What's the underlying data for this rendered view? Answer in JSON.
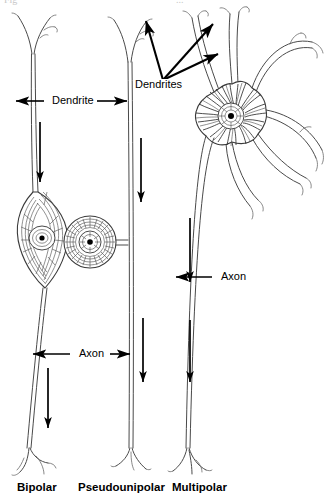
{
  "figure": {
    "background_color": "#ffffff",
    "ink_color": "#3a3a3a",
    "label_color": "#000000",
    "width": 331,
    "height": 500
  },
  "annotations": {
    "dendrite_label": "Dendrite",
    "dendrites_label": "Dendrites",
    "axon_label_bipolar": "Axon",
    "axon_label_multipolar": "Axon"
  },
  "type_labels": {
    "bipolar": "Bipolar",
    "pseudounipolar": "Pseudounipolar",
    "multipolar": "Multipolar"
  },
  "top_cropped_text": {
    "left": "Fig",
    "right": "..."
  },
  "cells": [
    {
      "name": "bipolar",
      "label": "Bipolar",
      "soma_shape": "fusiform-spindle",
      "soma_center_x": 44,
      "soma_center_y": 235,
      "dendrite_label": "Dendrite",
      "axon_label": "Axon",
      "process_count": 2
    },
    {
      "name": "pseudounipolar",
      "label": "Pseudounipolar",
      "soma_shape": "round",
      "soma_center_x": 96,
      "soma_center_y": 242,
      "axon_label": "",
      "process_count": 1
    },
    {
      "name": "multipolar",
      "label": "Multipolar",
      "soma_shape": "stellate-star",
      "soma_center_x": 240,
      "soma_center_y": 103,
      "dendrite_label": "Dendrites",
      "axon_label": "Axon",
      "process_count": 5
    }
  ],
  "flow_arrows": [
    {
      "name": "bipolar-dendrite-flow",
      "x": 40,
      "y1": 122,
      "y2": 182
    },
    {
      "name": "bipolar-axon-flow",
      "x": 48,
      "y1": 368,
      "y2": 428
    },
    {
      "name": "pseudounipolar-axon-flow-upper",
      "x": 141,
      "y1": 138,
      "y2": 202
    },
    {
      "name": "pseudounipolar-axon-flow-lower",
      "x": 143,
      "y1": 318,
      "y2": 382
    },
    {
      "name": "multipolar-axon-flow-upper",
      "x": 190,
      "y1": 218,
      "y2": 282
    },
    {
      "name": "multipolar-axon-flow-lower",
      "x": 190,
      "y1": 320,
      "y2": 382
    }
  ]
}
